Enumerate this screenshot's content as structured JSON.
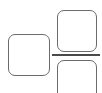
{
  "diagram": {
    "stroke_color": "#6b6b6b",
    "divider_color": "#4a4a4a",
    "shapes": [
      {
        "name": "left-box"
      },
      {
        "name": "top-right-box"
      },
      {
        "name": "bottom-right-box"
      },
      {
        "name": "divider-line"
      }
    ]
  }
}
